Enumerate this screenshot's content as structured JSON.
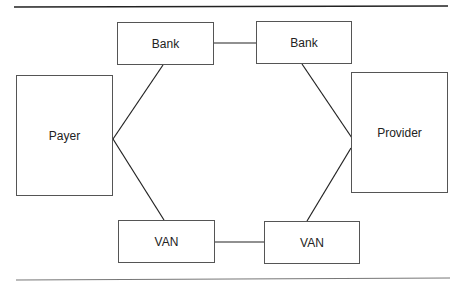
{
  "diagram": {
    "nodes": [
      {
        "id": "bank1",
        "label": "Bank"
      },
      {
        "id": "bank2",
        "label": "Bank"
      },
      {
        "id": "payer",
        "label": "Payer"
      },
      {
        "id": "provider",
        "label": "Provider"
      },
      {
        "id": "van1",
        "label": "VAN"
      },
      {
        "id": "van2",
        "label": "VAN"
      }
    ],
    "edges": [
      {
        "from": "bank1",
        "to": "bank2"
      },
      {
        "from": "payer",
        "to": "bank1"
      },
      {
        "from": "payer",
        "to": "van1"
      },
      {
        "from": "van1",
        "to": "van2"
      },
      {
        "from": "bank2",
        "to": "provider"
      },
      {
        "from": "van2",
        "to": "provider"
      }
    ],
    "colors": {
      "line": "#222222",
      "border": "#555555",
      "background": "#ffffff"
    }
  }
}
